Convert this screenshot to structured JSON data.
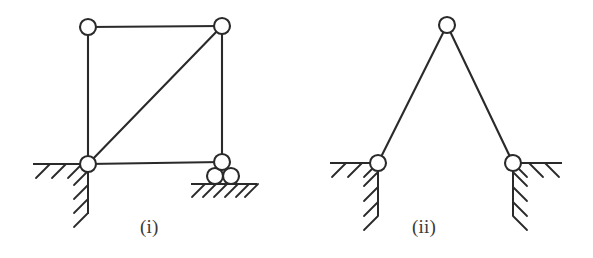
{
  "figures": [
    {
      "id": "figure-i",
      "label": "(i)",
      "description": "Rigid jointed square frame with diagonal brace, pin support at lower left and roller support at lower right",
      "nodes": [
        {
          "name": "top-left-node",
          "x": 88,
          "y": 27,
          "r": 8
        },
        {
          "name": "top-right-node",
          "x": 222,
          "y": 26,
          "r": 8
        },
        {
          "name": "bottom-left-node",
          "x": 88,
          "y": 164,
          "r": 8
        },
        {
          "name": "bottom-right-node",
          "x": 222,
          "y": 162,
          "r": 8
        }
      ],
      "members": [
        {
          "name": "top-chord",
          "x1": 88,
          "y1": 27,
          "x2": 222,
          "y2": 26
        },
        {
          "name": "left-column",
          "x1": 88,
          "y1": 27,
          "x2": 88,
          "y2": 164
        },
        {
          "name": "right-column",
          "x1": 222,
          "y1": 26,
          "x2": 222,
          "y2": 162
        },
        {
          "name": "bottom-chord",
          "x1": 88,
          "y1": 164,
          "x2": 222,
          "y2": 162
        },
        {
          "name": "diagonal-brace",
          "x1": 88,
          "y1": 164,
          "x2": 222,
          "y2": 26
        }
      ],
      "supports": [
        {
          "name": "pin-support-left",
          "type": "pin",
          "ground_h": {
            "x1": 33,
            "y1": 164,
            "x2": 88,
            "y2": 164
          },
          "ground_v": {
            "x1": 88,
            "y1": 164,
            "x2": 88,
            "y2": 214
          },
          "hatch_h_count": 3,
          "hatch_v_count": 4
        },
        {
          "name": "roller-support-right",
          "type": "roller",
          "rollers": [
            {
              "x": 215,
              "y": 176,
              "r": 8
            },
            {
              "x": 231,
              "y": 176,
              "r": 8
            }
          ],
          "ground_h": {
            "x1": 191,
            "y1": 184,
            "x2": 257,
            "y2": 184
          },
          "hatch_h_count": 6
        }
      ]
    },
    {
      "id": "figure-ii",
      "label": "(ii)",
      "description": "Two bar A-frame with pin supports at both bases",
      "nodes": [
        {
          "name": "apex-node",
          "x": 447,
          "y": 25,
          "r": 8
        },
        {
          "name": "left-base-node",
          "x": 378,
          "y": 163,
          "r": 8
        },
        {
          "name": "right-base-node",
          "x": 513,
          "y": 163,
          "r": 8
        }
      ],
      "members": [
        {
          "name": "left-bar",
          "x1": 447,
          "y1": 25,
          "x2": 378,
          "y2": 163
        },
        {
          "name": "right-bar",
          "x1": 447,
          "y1": 25,
          "x2": 513,
          "y2": 163
        }
      ],
      "supports": [
        {
          "name": "pin-support-left",
          "type": "pin",
          "ground_h": {
            "x1": 330,
            "y1": 163,
            "x2": 378,
            "y2": 163
          },
          "ground_v": {
            "x1": 378,
            "y1": 163,
            "x2": 378,
            "y2": 216
          },
          "hatch_h_count": 3,
          "hatch_v_count": 4
        },
        {
          "name": "pin-support-right",
          "type": "pin",
          "ground_h": {
            "x1": 513,
            "y1": 163,
            "x2": 562,
            "y2": 163
          },
          "ground_v": {
            "x1": 513,
            "y1": 163,
            "x2": 513,
            "y2": 216
          },
          "hatch_h_count": 3,
          "hatch_v_count": 4
        }
      ]
    }
  ],
  "colors": {
    "background": "#ffffff",
    "ink": "#2a2a2a",
    "label": "#3a3a3a"
  }
}
